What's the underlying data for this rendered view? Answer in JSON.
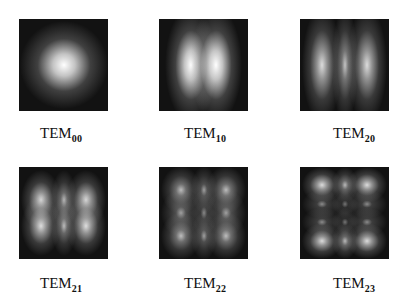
{
  "figure": {
    "panels": [
      {
        "id": "tem00",
        "label_main": "TEM",
        "label_sub": "00",
        "m": 0,
        "n": 0,
        "x": 19,
        "y": 19,
        "label_x": 40,
        "label_y": 125
      },
      {
        "id": "tem10",
        "label_main": "TEM",
        "label_sub": "10",
        "m": 1,
        "n": 0,
        "x": 159,
        "y": 19,
        "label_x": 184,
        "label_y": 125
      },
      {
        "id": "tem20",
        "label_main": "TEM",
        "label_sub": "20",
        "m": 2,
        "n": 0,
        "x": 300,
        "y": 19,
        "label_x": 333,
        "label_y": 125
      },
      {
        "id": "tem21",
        "label_main": "TEM",
        "label_sub": "21",
        "m": 2,
        "n": 1,
        "x": 19,
        "y": 167,
        "label_x": 40,
        "label_y": 275
      },
      {
        "id": "tem22",
        "label_main": "TEM",
        "label_sub": "22",
        "m": 2,
        "n": 2,
        "x": 159,
        "y": 167,
        "label_x": 184,
        "label_y": 275
      },
      {
        "id": "tem23",
        "label_main": "TEM",
        "label_sub": "23",
        "m": 2,
        "n": 3,
        "x": 300,
        "y": 167,
        "label_x": 333,
        "label_y": 275
      }
    ],
    "colors": {
      "background": "#ffffff",
      "panel": "#121212",
      "text": "#111111"
    }
  }
}
